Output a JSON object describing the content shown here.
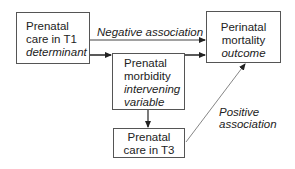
{
  "nodes": {
    "t1": {
      "line1": "Prenatal",
      "line2": "care in T1",
      "role": "determinant"
    },
    "morbidity": {
      "line1": "Prenatal",
      "line2": "morbidity",
      "role1": "intervening",
      "role2": "variable"
    },
    "outcome": {
      "line1": "Perinatal",
      "line2": "mortality",
      "role": "outcome"
    },
    "t3": {
      "line1": "Prenatal",
      "line2": "care in T3"
    }
  },
  "edges": {
    "negative": {
      "label": "Negative association"
    },
    "positive": {
      "label1": "Positive",
      "label2": "association"
    }
  }
}
